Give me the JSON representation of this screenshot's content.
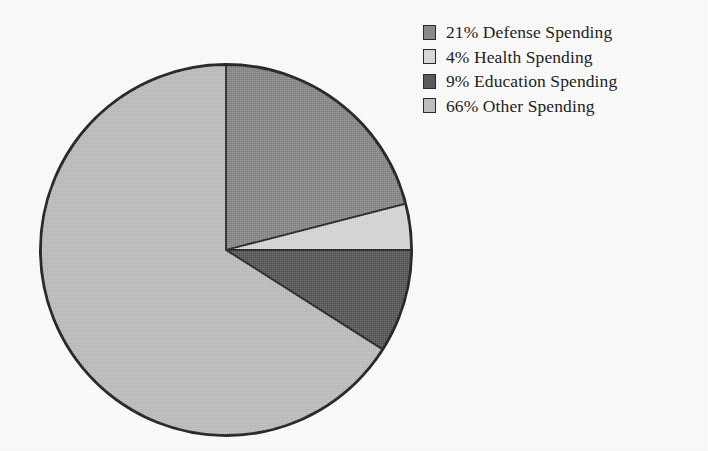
{
  "chart_data": {
    "type": "pie",
    "title": "",
    "subtitle": "",
    "xlabel": "",
    "ylabel": "",
    "grid": false,
    "legend_position": "top-right",
    "start_angle_deg": 0,
    "direction": "clockwise",
    "units": "percent",
    "total": 100,
    "categories": [
      "Defense Spending",
      "Health Spending",
      "Education Spending",
      "Other Spending"
    ],
    "values": [
      21,
      4,
      9,
      66
    ],
    "slices": [
      {
        "label": "Defense Spending",
        "value": 21,
        "percent_text": "21%",
        "legend_text": "21% Defense Spending",
        "color": "#8d8d8d",
        "sweep_deg": 75.6,
        "start_deg": 0,
        "end_deg": 75.6
      },
      {
        "label": "Health Spending",
        "value": 4,
        "percent_text": "4%",
        "legend_text": "4% Health Spending",
        "color": "#dddddd",
        "sweep_deg": 14.4,
        "start_deg": 75.6,
        "end_deg": 90
      },
      {
        "label": "Education Spending",
        "value": 9,
        "percent_text": "9%",
        "legend_text": "9% Education Spending",
        "color": "#5c5c5c",
        "sweep_deg": 32.4,
        "start_deg": 90,
        "end_deg": 122.4
      },
      {
        "label": "Other Spending",
        "value": 66,
        "percent_text": "66%",
        "legend_text": "66% Other Spending",
        "color": "#c3c3c3",
        "sweep_deg": 237.6,
        "start_deg": 122.4,
        "end_deg": 360
      }
    ],
    "stroke_color": "#2b2b2b",
    "background_color": "#ffffff"
  },
  "legend": {
    "items": [
      {
        "text": "21% Defense Spending",
        "color": "#8d8d8d"
      },
      {
        "text": "4% Health Spending",
        "color": "#dddddd"
      },
      {
        "text": "9% Education Spending",
        "color": "#5c5c5c"
      },
      {
        "text": "66% Other Spending",
        "color": "#c3c3c3"
      }
    ]
  }
}
